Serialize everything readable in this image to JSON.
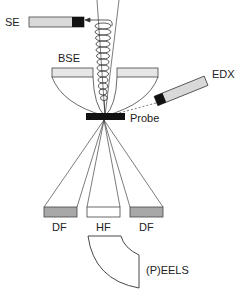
{
  "diagram": {
    "labels": {
      "se": "SE",
      "bse": "BSE",
      "edx": "EDX",
      "probe": "Probe",
      "df_left": "DF",
      "hf": "HF",
      "df_right": "DF",
      "eels": "(P)EELS"
    },
    "colors": {
      "line": "#444444",
      "detector_fill_light": "#d9d9d9",
      "detector_fill_dark": "#a8a8a8",
      "detector_sensor": "#111111",
      "probe": "#111111",
      "background": "#ffffff"
    }
  }
}
